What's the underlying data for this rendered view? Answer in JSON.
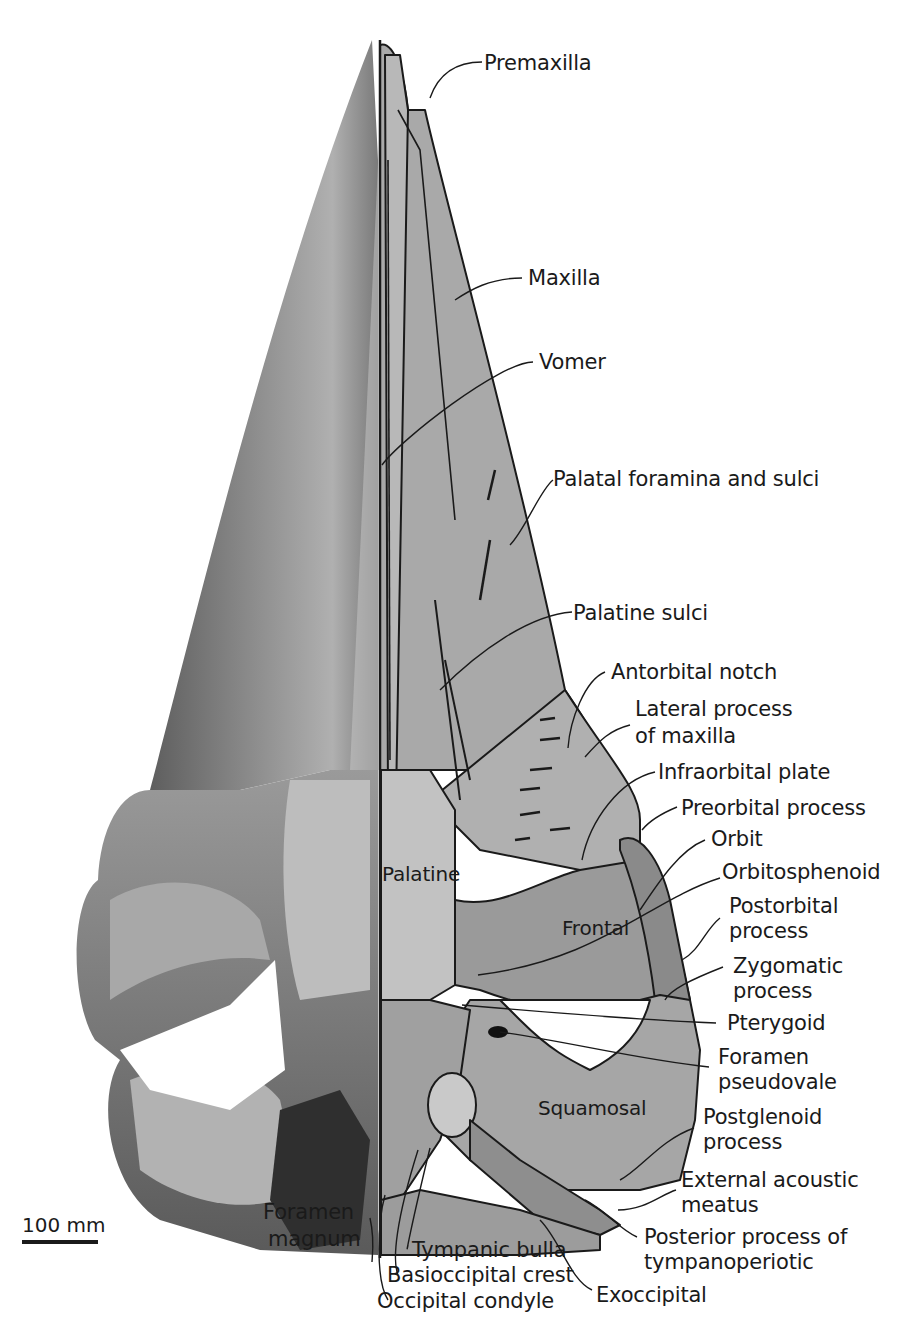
{
  "figure": {
    "colors": {
      "background": "#ffffff",
      "bone_photo_dark": "#6f6f6f",
      "bone_photo_light": "#b4b4b4",
      "drawing_fill": "#a9a9a9",
      "drawing_fill_light": "#c2c2c2",
      "drawing_fill_dark": "#8a8a8a",
      "outline": "#1a1a1a"
    },
    "scale_bar": {
      "label": "100 mm"
    },
    "interior_labels": {
      "palatine": "Palatine",
      "frontal": "Frontal",
      "squamosal": "Squamosal"
    },
    "labels": [
      {
        "id": "premaxilla",
        "text": "Premaxilla"
      },
      {
        "id": "maxilla",
        "text": "Maxilla"
      },
      {
        "id": "vomer",
        "text": "Vomer"
      },
      {
        "id": "palatal-foramina",
        "text": "Palatal foramina and sulci"
      },
      {
        "id": "palatine-sulci",
        "text": "Palatine sulci"
      },
      {
        "id": "antorbital-notch",
        "text": "Antorbital notch"
      },
      {
        "id": "lateral-process",
        "text": "Lateral process",
        "text2": "of maxilla"
      },
      {
        "id": "infraorbital-plate",
        "text": "Infraorbital plate"
      },
      {
        "id": "preorbital-process",
        "text": "Preorbital process"
      },
      {
        "id": "orbit",
        "text": "Orbit"
      },
      {
        "id": "orbitosphenoid",
        "text": "Orbitosphenoid"
      },
      {
        "id": "postorbital-process",
        "text": "Postorbital",
        "text2": "process"
      },
      {
        "id": "zygomatic-process",
        "text": "Zygomatic",
        "text2": "process"
      },
      {
        "id": "pterygoid",
        "text": "Pterygoid"
      },
      {
        "id": "foramen-pseudovale",
        "text": "Foramen",
        "text2": "pseudovale"
      },
      {
        "id": "postglenoid-process",
        "text": "Postglenoid",
        "text2": "process"
      },
      {
        "id": "external-acoustic-meatus",
        "text": "External acoustic",
        "text2": "meatus"
      },
      {
        "id": "posterior-process",
        "text": "Posterior process of",
        "text2": "tympanoperiotic"
      },
      {
        "id": "exoccipital",
        "text": "Exoccipital"
      },
      {
        "id": "foramen-magnum",
        "text": "Foramen",
        "text2": "magnum"
      },
      {
        "id": "tympanic-bulla",
        "text": "Tympanic bulla"
      },
      {
        "id": "basioccipital-crest",
        "text": "Basioccipital crest"
      },
      {
        "id": "occipital-condyle",
        "text": "Occipital condyle"
      }
    ]
  }
}
